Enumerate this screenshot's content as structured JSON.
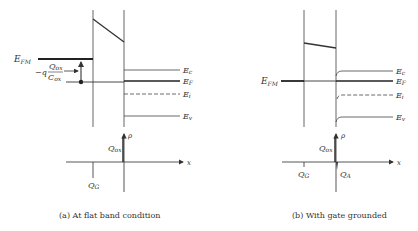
{
  "panels": [
    {
      "id": "a",
      "caption": "(a)  At flat band condition",
      "band_labels": {
        "metal_fermi": {
          "main": "E",
          "sub": "FM"
        },
        "oxide_charge_drop": {
          "prefix": "−q",
          "num_main": "Q",
          "num_sub": "ox",
          "den_main": "C",
          "den_sub": "ox"
        },
        "Ec": {
          "main": "E",
          "sub": "c"
        },
        "EF": {
          "main": "E",
          "sub": "F"
        },
        "Ei": {
          "main": "E",
          "sub": "i"
        },
        "Ev": {
          "main": "E",
          "sub": "v"
        }
      },
      "charge_labels": {
        "Qox": {
          "main": "Q",
          "sub": "ox"
        },
        "QG": {
          "main": "Q",
          "sub": "G"
        },
        "rho": "ρ",
        "x": "x"
      }
    },
    {
      "id": "b",
      "caption": "(b)  With gate grounded",
      "band_labels": {
        "metal_fermi": {
          "main": "E",
          "sub": "FM"
        },
        "Ec": {
          "main": "E",
          "sub": "c"
        },
        "EF": {
          "main": "E",
          "sub": "F"
        },
        "Ei": {
          "main": "E",
          "sub": "i"
        },
        "Ev": {
          "main": "E",
          "sub": "v"
        }
      },
      "charge_labels": {
        "Qox": {
          "main": "Q",
          "sub": "ox"
        },
        "QG": {
          "main": "Q",
          "sub": "G"
        },
        "QA": {
          "main": "Q",
          "sub": "A"
        },
        "rho": "ρ",
        "x": "x"
      }
    }
  ],
  "colors": {
    "line": "#333333",
    "text": "#333333",
    "background": "#ffffff"
  }
}
